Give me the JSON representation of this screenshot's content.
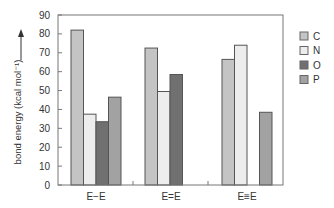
{
  "chart_data": {
    "type": "bar",
    "title": "",
    "xlabel": "",
    "ylabel": "bond energy (kcal mol⁻¹)",
    "ylim": [
      0,
      90
    ],
    "yticks": [
      0,
      10,
      20,
      30,
      40,
      50,
      60,
      70,
      80,
      90
    ],
    "grid": false,
    "legend_position": "right",
    "categories": [
      "E−E",
      "E=E",
      "E≡E"
    ],
    "series": [
      {
        "name": "C",
        "color": "#c4c4c4",
        "values": [
          82,
          72.5,
          66.5
        ]
      },
      {
        "name": "N",
        "color": "#ededed",
        "values": [
          37.5,
          49.5,
          74
        ]
      },
      {
        "name": "O",
        "color": "#707070",
        "values": [
          33.5,
          58.5,
          null
        ]
      },
      {
        "name": "P",
        "color": "#a2a2a2",
        "values": [
          46.5,
          null,
          38.5
        ]
      }
    ]
  },
  "labels": {
    "ylabel": "bond energy (kcal mol⁻¹)",
    "categories": [
      "E−E",
      "E=E",
      "E≡E"
    ],
    "legend": [
      "C",
      "N",
      "O",
      "P"
    ],
    "yticks": [
      "0",
      "10",
      "20",
      "30",
      "40",
      "50",
      "60",
      "70",
      "80",
      "90"
    ]
  }
}
